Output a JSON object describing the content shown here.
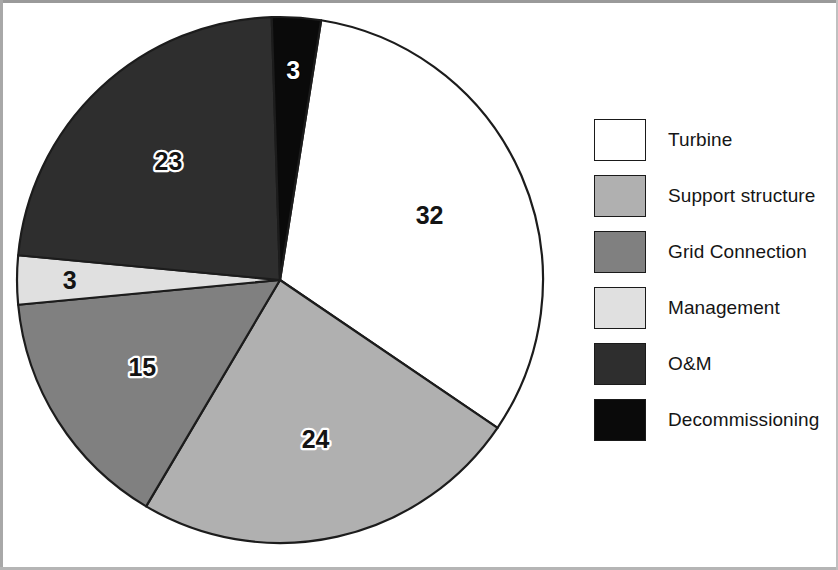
{
  "chart_data": {
    "type": "pie",
    "title": "",
    "subtitle": "",
    "xlabel": "",
    "ylabel": "",
    "grid": false,
    "legend_position": "right",
    "total": 100,
    "units": "percent",
    "start_angle_deg": 9,
    "direction": "clockwise",
    "categories": [
      "Turbine",
      "Support structure",
      "Grid Connection",
      "Management",
      "O&M",
      "Decommissioning"
    ],
    "values": [
      32,
      24,
      15,
      3,
      23,
      3
    ],
    "labels": [
      "32",
      "24",
      "15",
      "3",
      "23",
      "3"
    ],
    "colors": [
      "#ffffff",
      "#b0b0b0",
      "#808080",
      "#e0e0e0",
      "#2e2e2e",
      "#0a0a0a"
    ],
    "label_styles": [
      "plain",
      "halo-txt",
      "halo-txt",
      "plain",
      "halo-txt",
      "white-txt"
    ],
    "slices": [
      {
        "name": "Turbine",
        "value": 32,
        "label": "32",
        "color": "#ffffff",
        "label_style": "plain"
      },
      {
        "name": "Support structure",
        "value": 24,
        "label": "24",
        "color": "#b0b0b0",
        "label_style": "halo-txt"
      },
      {
        "name": "Grid Connection",
        "value": 15,
        "label": "15",
        "color": "#808080",
        "label_style": "halo-txt"
      },
      {
        "name": "Management",
        "value": 3,
        "label": "3",
        "color": "#e0e0e0",
        "label_style": "plain"
      },
      {
        "name": "O&M",
        "value": 23,
        "label": "23",
        "color": "#2e2e2e",
        "label_style": "halo-txt"
      },
      {
        "name": "Decommissioning",
        "value": 3,
        "label": "3",
        "color": "#0a0a0a",
        "label_style": "white-txt"
      }
    ]
  },
  "legend": {
    "items": [
      {
        "label": "Turbine",
        "color": "#ffffff"
      },
      {
        "label": "Support structure",
        "color": "#b0b0b0"
      },
      {
        "label": "Grid Connection",
        "color": "#808080"
      },
      {
        "label": "Management",
        "color": "#e0e0e0"
      },
      {
        "label": "O&M",
        "color": "#2e2e2e"
      },
      {
        "label": "Decommissioning",
        "color": "#0a0a0a"
      }
    ]
  },
  "style": {
    "outline_color": "#1c1c1c",
    "background": "#ffffff"
  }
}
